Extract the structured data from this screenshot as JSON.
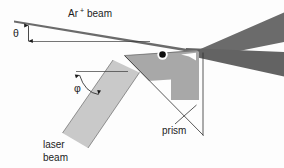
{
  "figure": {
    "background_color": "#fdfdfd",
    "width": 284,
    "height": 168
  },
  "labels": {
    "ion_beam_species": "Ar",
    "ion_beam_charge": "+",
    "ion_beam_word": "beam",
    "theta_symbol": "θ",
    "phi_symbol": "φ",
    "prism": "prism",
    "laser_line1": "laser",
    "laser_line2": "beam"
  },
  "elements": {
    "ion_beam": {
      "name": "Ar+ beam",
      "color": "#6b6b6b",
      "description": "narrow wedge entering from upper left, widening to the right"
    },
    "reflected_beam": {
      "name": "reflected beam",
      "color": "#636363",
      "description": "second wedge crossing the incident beam at right"
    },
    "prism": {
      "name": "prism",
      "color": "#a8a8a8",
      "description": "right triangular prism with notched right face"
    },
    "laser_beam": {
      "name": "laser beam",
      "color": "#c9c9c9",
      "description": "rotated rectangular beam entering from lower left"
    },
    "interaction_point": {
      "name": "interaction point",
      "color": "#0d0d0d",
      "description": "black dot with white ring on prism top surface"
    }
  },
  "angles": {
    "theta": {
      "symbol": "θ",
      "marker": "vertical double-headed arrow",
      "measured_between": "horizontal reference line and Ar+ beam axis"
    },
    "phi": {
      "symbol": "φ",
      "marker": "curved double-headed arrow",
      "measured_between": "horizontal reference line and laser beam axis"
    }
  }
}
